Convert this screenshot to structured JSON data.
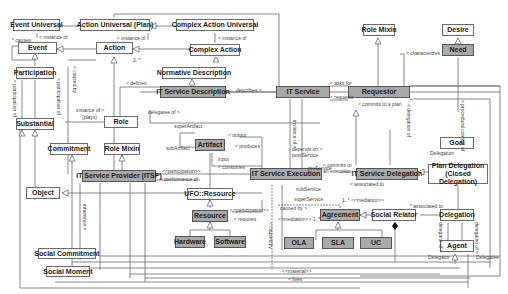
{
  "classes": {
    "event_universal": "Event Universal",
    "action_universal_plan": "Action Universal (Plan)",
    "complex_action_universal": "Complex Action Universal",
    "event": "Event",
    "action": "Action",
    "complex_action": "Complex Action",
    "participation": "Participation",
    "normative_description": "Normative Description",
    "it_service_description": "IT Service Description",
    "it_service": "IT Service",
    "role_mixin_top": "Role Mixin",
    "desire": "Desire",
    "need": "Need",
    "requestor": "Requestor",
    "substantial": "Substantial",
    "role": "Role",
    "goal": "Goal",
    "commitment": "Commitment",
    "role_mixin": "Role Mixin",
    "artifact": "Artifact",
    "it_service_provider": "IT Service Provider (ITSP)",
    "it_service_execution": "IT Service Execution",
    "it_service_delegation": "IT Service Delegation",
    "plan_delegation": "Plan Delegation (Closed Delegation)",
    "object": "Object",
    "ufo_resource": "UFO::Resource",
    "resource": "Resource",
    "hardware": "Hardware",
    "software": "Software",
    "agreement": "Agreement",
    "social_relator": "Social Relator",
    "delegation": "Delegation",
    "ola": "OLA",
    "sla": "SLA",
    "uc": "UC",
    "agent": "Agent",
    "social_commitment": "Social Commitment",
    "social_moment": "Social Moment"
  },
  "labels": {
    "causes": "* causes",
    "instance_of_1": "< instance of",
    "instance_of_2": "< instance of",
    "instance_of_3": "< instance of",
    "two_star": "2..*",
    "caused_by": "< caused by",
    "participation_of": "< participation of",
    "participation_of_2": "< participation of",
    "defines": "< defines",
    "describes": "describes >",
    "asks_for": "< asks for",
    "requests": "< requests",
    "characterizes": "< characterizes",
    "instance_of_plays": "instance of >",
    "plays": "(plays)",
    "delegatee_of": "delegatee of >",
    "super_artifact": "superArtifact",
    "sub_artifact": "subArtifact",
    "output": "< output",
    "produces": "< produces",
    "input": "input",
    "consumes": "< consumes",
    "depends_on": "depends on >",
    "post_service": "postService",
    "pre_service": "preService",
    "sub_service": "subService",
    "super_service": "superService",
    "commits_to_plan": "< commits to a plan",
    "commits_to_execution": "< commits to an execution",
    "delegation_of": "< delegation of",
    "procedural_content_of": "< procedural content of",
    "delegatum": "Delegatum",
    "participation_stereo": "<<participation>>",
    "performance_of": "< performance of",
    "participation_stereo_2": "<<participation>>",
    "requires": "< requires",
    "instance_of_v": "instance of >",
    "associated_to": "< associated to",
    "mediation_1": "1..* <<mediation>>",
    "mediation_2": "<<mediation>> 1..*",
    "associated_to_2": "* associated to",
    "caused_by_2": "caused by >",
    "caused_by_v": "< caused by",
    "inherence": "inherence >",
    "material": "<<material>>",
    "lives": "< lives",
    "delegator_of": "delegator of >",
    "delegatee_of_v": "delegatee of >",
    "delegator": "Delegator",
    "delegatee": "Delegatee",
    "one": "1",
    "one_star": "1..*",
    "zero_star": "0..*",
    "star": "*"
  },
  "colors": {
    "dark_fill": "#a9a9a9",
    "light_fill": "#ffffff",
    "line": "#6a6a6a"
  }
}
